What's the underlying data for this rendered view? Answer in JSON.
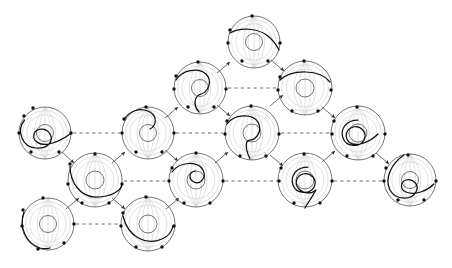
{
  "figure": {
    "background_color": "#ffffff",
    "stroke_color": "#3a3a3a",
    "curve_color": "#101010",
    "ghost_color": "#d2d2d2",
    "width": 452,
    "height": 268,
    "node_count": 14,
    "arrow_count": 18,
    "dashed_count": 7
  },
  "legend": {
    "node_label": "annulus-node",
    "arrow_label": "transition-arrow",
    "dashed_label": "equivalence-link"
  },
  "nodes": [
    {
      "id": "n1",
      "label": "A1",
      "cx": 45,
      "cy": 133,
      "r": 26,
      "inner_r": 8.5,
      "curve": "M 24.5 120 C 16 131, 22 147, 36 148 C 48 149, 54 141, 50 134 C 46 127, 36 128, 34 134 C 32 141, 40 146, 49 144 C 58 142, 66 137, 70 134",
      "dots": [
        [
          24,
          116
        ],
        [
          19,
          133
        ],
        [
          31,
          152
        ],
        [
          59,
          152
        ],
        [
          71,
          133
        ],
        [
          33,
          108
        ]
      ]
    },
    {
      "id": "n2",
      "label": "A2",
      "cx": 95,
      "cy": 180,
      "r": 27,
      "inner_r": 9,
      "curve": "M 70 166 C 70 182, 80 197, 96 197 C 112 197, 122 190, 122 184",
      "dots": [
        [
          70,
          164
        ],
        [
          68,
          184
        ],
        [
          82,
          203
        ],
        [
          109,
          203
        ],
        [
          122,
          184
        ],
        [
          95,
          154
        ]
      ]
    },
    {
      "id": "n3",
      "label": "A3",
      "cx": 48,
      "cy": 224,
      "r": 26,
      "inner_r": 8.5,
      "curve": "M 24 212 C 19 226, 25 243, 40 248 C 44 249, 47 249, 50 248",
      "dots": [
        [
          23,
          210
        ],
        [
          22,
          226
        ],
        [
          38,
          249
        ],
        [
          64,
          243
        ],
        [
          74,
          224
        ],
        [
          43,
          198
        ]
      ]
    },
    {
      "id": "n4",
      "label": "A4",
      "cx": 148,
      "cy": 133,
      "r": 26,
      "inner_r": 8.5,
      "curve": "M 124 120 C 128 112, 140 106, 150 112 C 158 117, 156 126, 150 129",
      "dots": [
        [
          124,
          119
        ],
        [
          122,
          133
        ],
        [
          136,
          152
        ],
        [
          162,
          152
        ],
        [
          174,
          133
        ],
        [
          146,
          107
        ]
      ]
    },
    {
      "id": "n5",
      "label": "A5",
      "cx": 196,
      "cy": 180,
      "r": 27,
      "inner_r": 9,
      "curve": "M 172 172 C 180 161, 198 161, 203 170 C 207 178, 200 185, 194 182 C 188 179, 189 172, 195 171",
      "dots": [
        [
          172,
          168
        ],
        [
          169,
          181
        ],
        [
          184,
          203
        ],
        [
          210,
          203
        ],
        [
          223,
          181
        ],
        [
          196,
          153
        ]
      ]
    },
    {
      "id": "n6",
      "label": "A6",
      "cx": 148,
      "cy": 224,
      "r": 27,
      "inner_r": 9,
      "curve": "M 123 216 C 128 237, 146 246, 162 239 C 169 236, 172 231, 173 226",
      "dots": [
        [
          123,
          213
        ],
        [
          121,
          226
        ],
        [
          136,
          247
        ],
        [
          162,
          247
        ],
        [
          174,
          226
        ],
        [
          146,
          197
        ]
      ]
    },
    {
      "id": "n7",
      "label": "A7",
      "cx": 200,
      "cy": 88,
      "r": 26,
      "inner_r": 8.5,
      "curve": "M 176 80 C 182 70, 198 67, 206 74 C 213 81, 208 92, 201 94 C 195 96, 192 104, 199 112",
      "dots": [
        [
          176,
          76
        ],
        [
          174,
          89
        ],
        [
          188,
          107
        ],
        [
          214,
          107
        ],
        [
          226,
          89
        ],
        [
          198,
          62
        ]
      ]
    },
    {
      "id": "n8",
      "label": "A8",
      "cx": 254,
      "cy": 42,
      "r": 26,
      "inner_r": 8.5,
      "curve": "M 230 33 C 240 27, 258 28, 268 36 C 274 41, 277 46, 279 50",
      "dots": [
        [
          230,
          30
        ],
        [
          228,
          43
        ],
        [
          242,
          61
        ],
        [
          268,
          61
        ],
        [
          280,
          43
        ],
        [
          252,
          16
        ]
      ]
    },
    {
      "id": "n9",
      "label": "A9",
      "cx": 252,
      "cy": 133,
      "r": 27,
      "inner_r": 9,
      "curve": "M 227 124 C 234 114, 252 113, 258 122 C 263 131, 256 140, 250 140 C 246 140, 244 146, 250 159",
      "dots": [
        [
          227,
          121
        ],
        [
          225,
          134
        ],
        [
          240,
          156
        ],
        [
          266,
          156
        ],
        [
          279,
          134
        ],
        [
          251,
          106
        ]
      ]
    },
    {
      "id": "n10",
      "label": "A10",
      "cx": 305,
      "cy": 88,
      "r": 27,
      "inner_r": 9,
      "curve": "M 280 80 C 292 69, 320 69, 330 82",
      "dots": [
        [
          280,
          77
        ],
        [
          278,
          90
        ],
        [
          292,
          111
        ],
        [
          318,
          111
        ],
        [
          331,
          90
        ],
        [
          304,
          61
        ]
      ]
    },
    {
      "id": "n11",
      "label": "A11",
      "cx": 305,
      "cy": 180,
      "r": 27,
      "inner_r": 9,
      "curve": "M 308 167 C 296 167, 290 176, 293 185 C 296 194, 310 195, 314 187 C 318 179, 310 172, 303 174 C 296 176, 294 184, 299 189 C 304 194, 312 194, 316 190 C 312 197, 308 203, 305 208",
      "dots": [
        [
          281,
          168
        ],
        [
          279,
          181
        ],
        [
          294,
          203
        ],
        [
          320,
          203
        ],
        [
          332,
          181
        ],
        [
          304,
          154
        ]
      ]
    },
    {
      "id": "n12",
      "label": "A12",
      "cx": 358,
      "cy": 133,
      "r": 27,
      "inner_r": 9,
      "curve": "M 358 120 C 346 120, 340 129, 343 138 C 346 147, 360 148, 364 140 C 368 132, 360 125, 353 127 C 346 129, 344 137, 349 142 C 356 148, 370 142, 378 134",
      "dots": [
        [
          334,
          121
        ],
        [
          332,
          134
        ],
        [
          347,
          156
        ],
        [
          373,
          156
        ],
        [
          385,
          134
        ],
        [
          357,
          107
        ]
      ]
    },
    {
      "id": "n13",
      "label": "A13",
      "cx": 410,
      "cy": 180,
      "r": 26,
      "inner_r": 8.5,
      "curve": "M 404 155 C 392 163, 384 178, 390 190 C 396 201, 412 200, 416 192 C 420 184, 412 178, 406 180 C 400 182, 400 190, 406 192 C 416 196, 428 190, 434 184",
      "dots": [
        [
          386,
          168
        ],
        [
          384,
          181
        ],
        [
          398,
          200
        ],
        [
          424,
          200
        ],
        [
          436,
          181
        ],
        [
          408,
          155
        ]
      ]
    },
    {
      "id": "n14",
      "label": "A14",
      "cx": 200,
      "cy": 180,
      "r": 0,
      "inner_r": 0,
      "curve": "",
      "dots": []
    }
  ],
  "arrows": [
    {
      "from": "n1",
      "to": "n2",
      "x1": 62,
      "y1": 152,
      "x2": 74,
      "y2": 163
    },
    {
      "from": "n3",
      "to": "n2",
      "x1": 66,
      "y1": 209,
      "x2": 79,
      "y2": 198
    },
    {
      "from": "n2",
      "to": "n4",
      "x1": 112,
      "y1": 163,
      "x2": 125,
      "y2": 152
    },
    {
      "from": "n2",
      "to": "n6",
      "x1": 112,
      "y1": 198,
      "x2": 125,
      "y2": 209
    },
    {
      "from": "n4",
      "to": "n7",
      "x1": 165,
      "y1": 118,
      "x2": 178,
      "y2": 107
    },
    {
      "from": "n4",
      "to": "n5",
      "x1": 165,
      "y1": 150,
      "x2": 178,
      "y2": 161
    },
    {
      "from": "n6",
      "to": "n5",
      "x1": 166,
      "y1": 209,
      "x2": 179,
      "y2": 198
    },
    {
      "from": "n7",
      "to": "n8",
      "x1": 217,
      "y1": 73,
      "x2": 230,
      "y2": 62
    },
    {
      "from": "n7",
      "to": "n9",
      "x1": 217,
      "y1": 105,
      "x2": 230,
      "y2": 116
    },
    {
      "from": "n5",
      "to": "n9",
      "x1": 215,
      "y1": 163,
      "x2": 228,
      "y2": 152
    },
    {
      "from": "n8",
      "to": "n10",
      "x1": 271,
      "y1": 60,
      "x2": 284,
      "y2": 71
    },
    {
      "from": "n9",
      "to": "n10",
      "x1": 270,
      "y1": 106,
      "x2": 283,
      "y2": 95
    },
    {
      "from": "n9",
      "to": "n11",
      "x1": 270,
      "y1": 155,
      "x2": 283,
      "y2": 166
    },
    {
      "from": "n10",
      "to": "n12",
      "x1": 322,
      "y1": 107,
      "x2": 335,
      "y2": 118
    },
    {
      "from": "n11",
      "to": "n12",
      "x1": 322,
      "y1": 162,
      "x2": 335,
      "y2": 151
    },
    {
      "from": "n12",
      "to": "n13",
      "x1": 376,
      "y1": 153,
      "x2": 389,
      "y2": 164
    }
  ],
  "dashed_links": [
    {
      "from": "n1",
      "to": "n4",
      "x1": 73,
      "y1": 133,
      "x2": 120,
      "y2": 133
    },
    {
      "from": "n4",
      "to": "n9",
      "x1": 176,
      "y1": 133,
      "x2": 223,
      "y2": 133
    },
    {
      "from": "n9",
      "to": "n12",
      "x1": 281,
      "y1": 133,
      "x2": 330,
      "y2": 133
    },
    {
      "from": "n7",
      "to": "n10",
      "x1": 228,
      "y1": 88,
      "x2": 276,
      "y2": 88
    },
    {
      "from": "n2",
      "to": "n5",
      "x1": 124,
      "y1": 181,
      "x2": 167,
      "y2": 181
    },
    {
      "from": "n5",
      "to": "n11",
      "x1": 225,
      "y1": 181,
      "x2": 277,
      "y2": 181
    },
    {
      "from": "n11",
      "to": "n13",
      "x1": 334,
      "y1": 181,
      "x2": 382,
      "y2": 181
    },
    {
      "from": "n3",
      "to": "n6",
      "x1": 76,
      "y1": 224,
      "x2": 119,
      "y2": 224
    }
  ]
}
